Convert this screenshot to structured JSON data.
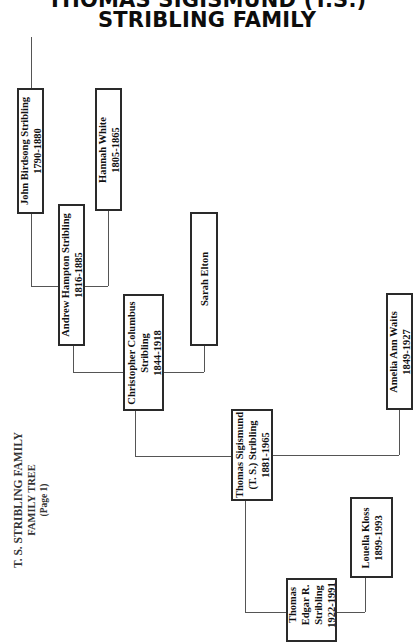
{
  "header": {
    "title_line1": "THOMAS SIGISMUND (T.S.)",
    "title_line2": "STRIBLING FAMILY"
  },
  "side_label": {
    "line1": "T. S. STRIBLING FAMILY",
    "line2": "FAMILY TREE",
    "line3": "(Page 1)"
  },
  "people": {
    "john": {
      "lines": [
        "John Birdsong Stribling",
        "1790-1880"
      ]
    },
    "hannah": {
      "lines": [
        "Hannah White",
        "1805-1865"
      ]
    },
    "andrew": {
      "lines": [
        "Andrew Hampton Stribling",
        "1816-1885"
      ]
    },
    "sarah": {
      "lines": [
        "Sarah Elton"
      ]
    },
    "christopher": {
      "lines": [
        "Christopher Columbus",
        "Stribling",
        "1844-1918"
      ]
    },
    "amelia": {
      "lines": [
        "Amelia Ann Waits",
        "1849-1927"
      ]
    },
    "ts": {
      "lines": [
        "Thomas Sigismund",
        "(T. S.) Stribling",
        "1881-1965"
      ]
    },
    "louella": {
      "lines": [
        "Louella Kloss",
        "1899-1993"
      ]
    },
    "thomas_edgar": {
      "lines": [
        "Thomas",
        "Edgar R.",
        "Stribling",
        "1922-1991"
      ]
    }
  },
  "colors": {
    "box_border": "#2a2a2a",
    "connector": "#555555",
    "background": "#ffffff"
  }
}
